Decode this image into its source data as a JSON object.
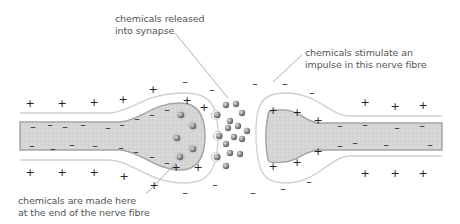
{
  "diagram": {
    "labels": {
      "released": {
        "line1": "chemicals released",
        "line2": "into synapse"
      },
      "stimulate": {
        "line1": "chemicals stimulate an",
        "line2": "impulse in this nerve fibre"
      },
      "made": {
        "line1": "chemicals are made here",
        "line2": "at the end of the nerve fibre"
      }
    },
    "charge_symbols": {
      "positive": "+",
      "negative": "–"
    },
    "colors": {
      "fibre_fill": "#d4d4d4",
      "fibre_edge": "#9a9a9a",
      "membrane_line": "#c8c8c8",
      "vesicle": "#8a8a8a",
      "text": "#555555",
      "leader_line": "#9a9a9a"
    },
    "components": [
      "presynaptic nerve fibre (left)",
      "presynaptic terminal with vesicles",
      "synaptic gap with released chemicals",
      "postsynaptic nerve fibre (right)"
    ]
  }
}
